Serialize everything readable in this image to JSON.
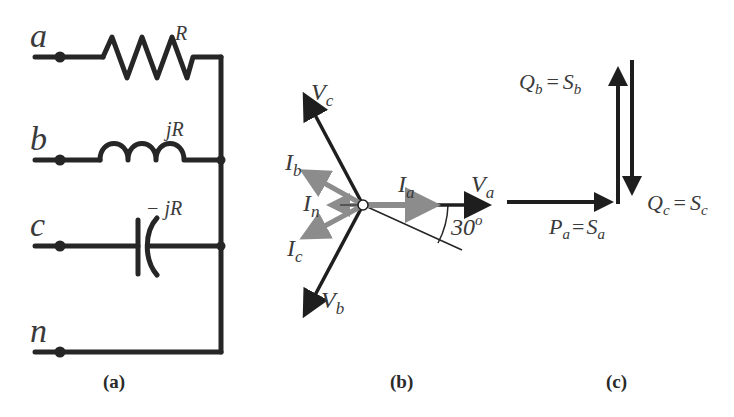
{
  "panel_a": {
    "caption": "(a)",
    "terminals": [
      {
        "label": "a",
        "element": "resistor",
        "element_label": "R"
      },
      {
        "label": "b",
        "element": "inductor",
        "element_label": "jR"
      },
      {
        "label": "c",
        "element": "capacitor",
        "element_label": "− jR"
      },
      {
        "label": "n",
        "element": "wire",
        "element_label": ""
      }
    ]
  },
  "panel_b": {
    "caption": "(b)",
    "voltage_phasors": [
      {
        "label": "V",
        "sub": "a"
      },
      {
        "label": "V",
        "sub": "b"
      },
      {
        "label": "V",
        "sub": "c"
      }
    ],
    "current_phasors": [
      {
        "label": "I",
        "sub": "a"
      },
      {
        "label": "I",
        "sub": "b"
      },
      {
        "label": "I",
        "sub": "c"
      },
      {
        "label": "I",
        "sub": "n"
      }
    ],
    "angle_label": "30",
    "angle_unit": "o",
    "colors": {
      "voltage": "#1e1e1e",
      "current": "#8c8c8c"
    }
  },
  "panel_c": {
    "caption": "(c)",
    "powers": [
      {
        "lhs": "P",
        "lhs_sub": "a",
        "rhs": "S",
        "rhs_sub": "a"
      },
      {
        "lhs": "Q",
        "lhs_sub": "b",
        "rhs": "S",
        "rhs_sub": "b"
      },
      {
        "lhs": "Q",
        "lhs_sub": "c",
        "rhs": "S",
        "rhs_sub": "c"
      }
    ],
    "equals": "="
  }
}
